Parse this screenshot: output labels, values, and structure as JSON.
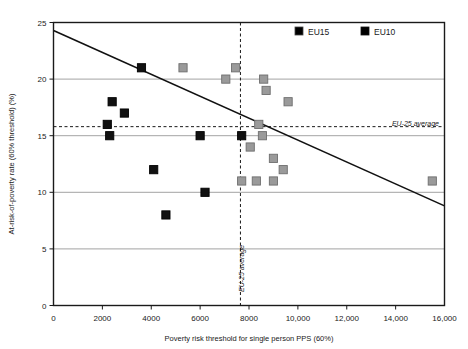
{
  "chart_data": {
    "type": "scatter",
    "title": "",
    "xlabel": "Poverty risk threshold for single person PPS (60%)",
    "ylabel": "At-risk-of-poverty rate (60% threshold) (%)",
    "xlim": [
      0,
      16000
    ],
    "ylim": [
      0,
      25
    ],
    "xticks": [
      0,
      2000,
      4000,
      6000,
      8000,
      10000,
      12000,
      14000,
      16000
    ],
    "xticklabels": [
      "0",
      "2000",
      "4000",
      "6000",
      "8000",
      "10,000",
      "12,000",
      "14,000",
      "16,000"
    ],
    "yticks": [
      0,
      5,
      10,
      15,
      20,
      25
    ],
    "yticklabels": [
      "0",
      "5",
      "10",
      "15",
      "20",
      "25"
    ],
    "grid": "horizontal",
    "legend_position": "top-right",
    "series": [
      {
        "name": "EU15",
        "color": "#9a9a9a",
        "marker": "square",
        "points": [
          {
            "x": 5300,
            "y": 21.0
          },
          {
            "x": 7450,
            "y": 21.0
          },
          {
            "x": 7050,
            "y": 20.0
          },
          {
            "x": 8600,
            "y": 20.0
          },
          {
            "x": 9600,
            "y": 18.0
          },
          {
            "x": 8700,
            "y": 19.0
          },
          {
            "x": 8400,
            "y": 16.0
          },
          {
            "x": 8550,
            "y": 15.0
          },
          {
            "x": 8050,
            "y": 14.0
          },
          {
            "x": 9000,
            "y": 13.0
          },
          {
            "x": 9400,
            "y": 12.0
          },
          {
            "x": 7700,
            "y": 11.0
          },
          {
            "x": 8300,
            "y": 11.0
          },
          {
            "x": 9000,
            "y": 11.0
          },
          {
            "x": 15500,
            "y": 11.0
          }
        ]
      },
      {
        "name": "EU10",
        "color": "#111111",
        "marker": "square",
        "points": [
          {
            "x": 3600,
            "y": 21.0
          },
          {
            "x": 2400,
            "y": 18.0
          },
          {
            "x": 2900,
            "y": 17.0
          },
          {
            "x": 2200,
            "y": 16.0
          },
          {
            "x": 2300,
            "y": 15.0
          },
          {
            "x": 6000,
            "y": 15.0
          },
          {
            "x": 7700,
            "y": 15.0
          },
          {
            "x": 4100,
            "y": 12.0
          },
          {
            "x": 6200,
            "y": 10.0
          },
          {
            "x": 4600,
            "y": 8.0
          }
        ]
      }
    ],
    "trendline": {
      "name": "linear-fit",
      "x0": 0,
      "y0": 24.3,
      "x1": 16000,
      "y1": 8.8,
      "color": "#111111"
    },
    "annotations": [
      {
        "name": "eu25-average-horizontal",
        "label": "EU-25 average",
        "orientation": "horizontal",
        "value": 15.8,
        "style": "dashed"
      },
      {
        "name": "eu25-average-vertical",
        "label": "EU-25 average",
        "orientation": "vertical",
        "value": 7650,
        "style": "dashed"
      }
    ]
  },
  "legend": {
    "items": [
      {
        "label": "EU15",
        "color": "#9a9a9a"
      },
      {
        "label": "EU10",
        "color": "#111111"
      }
    ]
  },
  "axes": {
    "x_title": "Poverty risk threshold for single person PPS (60%)",
    "y_title": "At-risk-of-poverty rate (60% threshold) (%)"
  },
  "annotation_text": {
    "horizontal_average": "EU-25 average",
    "vertical_average": "EU-25 average"
  }
}
